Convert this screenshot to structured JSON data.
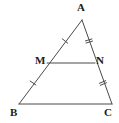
{
  "figure": {
    "kind": "geometry-diagram",
    "background_color": "#ffffff",
    "stroke_color": "#4a4a4a",
    "label_color": "#1b1b1b",
    "stroke_width": 1
  },
  "points": {
    "A": {
      "label": "A",
      "x": 82,
      "y": 20
    },
    "B": {
      "label": "B",
      "x": 19,
      "y": 104
    },
    "C": {
      "label": "C",
      "x": 112,
      "y": 104
    },
    "M": {
      "label": "M",
      "x": 47,
      "y": 63
    },
    "N": {
      "label": "N",
      "x": 95,
      "y": 63
    }
  },
  "segments": [
    {
      "name": "AB",
      "from": "A",
      "to": "B",
      "x1": 82,
      "y1": 20,
      "x2": 19,
      "y2": 104
    },
    {
      "name": "AC",
      "from": "A",
      "to": "C",
      "x1": 82,
      "y1": 20,
      "x2": 112,
      "y2": 104
    },
    {
      "name": "BC",
      "from": "B",
      "to": "C",
      "x1": 19,
      "y1": 104,
      "x2": 112,
      "y2": 104
    },
    {
      "name": "MN",
      "from": "M",
      "to": "N",
      "x1": 47,
      "y1": 63,
      "x2": 95,
      "y2": 63
    }
  ],
  "tick_marks": [
    {
      "name": "AM",
      "segment": "AM",
      "count": 1,
      "x": 65,
      "y": 41
    },
    {
      "name": "MB",
      "segment": "MB",
      "count": 1,
      "x": 33,
      "y": 83
    },
    {
      "name": "AN",
      "segment": "AN",
      "count": 2,
      "x": 89,
      "y": 41
    },
    {
      "name": "NC",
      "segment": "NC",
      "count": 2,
      "x": 103,
      "y": 83
    }
  ]
}
